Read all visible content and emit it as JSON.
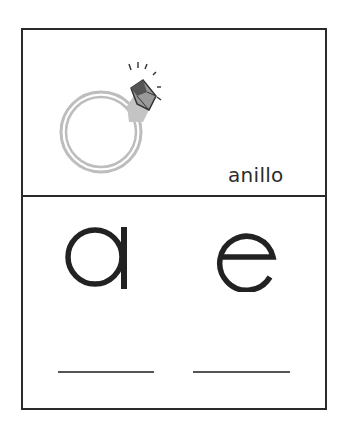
{
  "card": {
    "picture": {
      "icon": "ring-icon",
      "label": "anillo"
    },
    "letters": [
      {
        "char": "a",
        "answer_line": ""
      },
      {
        "char": "e",
        "answer_line": ""
      }
    ]
  },
  "colors": {
    "border": "#2a2a2a",
    "ring": "#bdbdbd",
    "gem": "#4a4a4a",
    "text": "#222222"
  }
}
